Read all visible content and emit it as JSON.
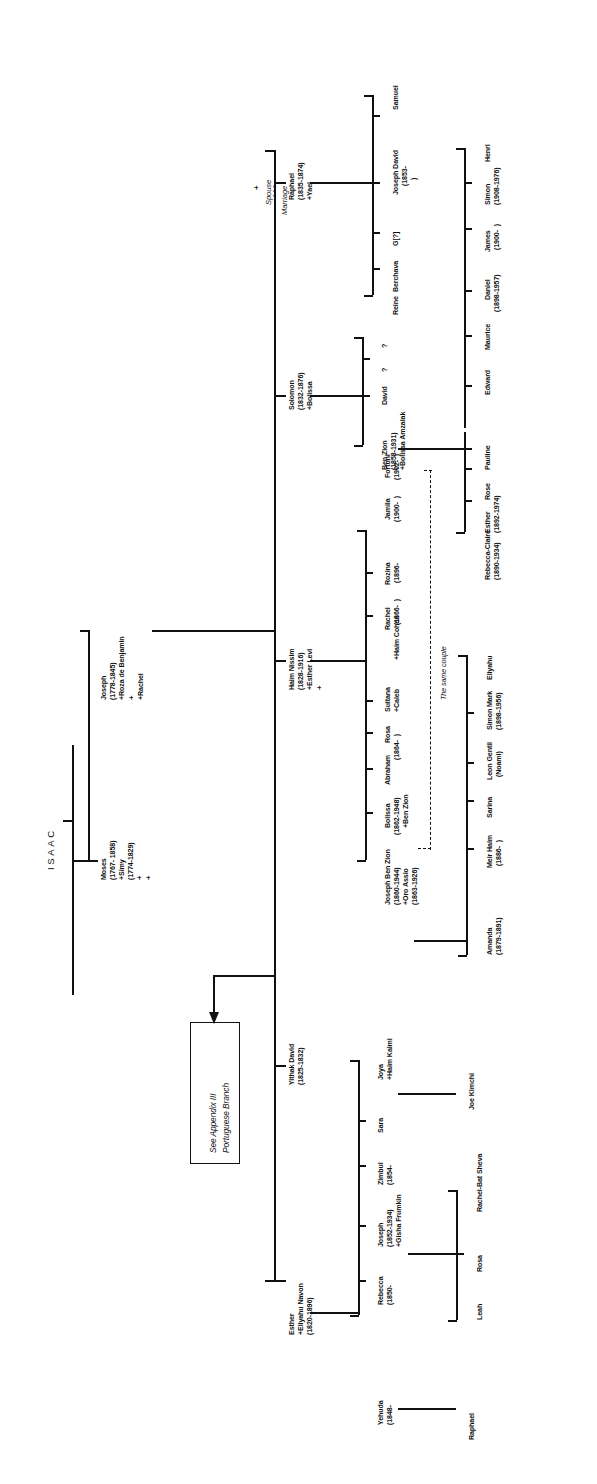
{
  "document": {
    "title": "ISAAC family genealogical chart",
    "root_label": "ISAAC",
    "orientation": "rotated-90",
    "legend": {
      "spouse_symbol": "+",
      "spouse_label": "Spouse",
      "marriage_symbol": "- - -",
      "marriage_label": "Marriage"
    },
    "callout_box": {
      "line1": "See Appendix III",
      "line2": "Portuguese Branch"
    },
    "annotations": {
      "same_couple": "The same couple"
    }
  },
  "generations": {
    "g1": [
      {
        "name": "Moses",
        "dates": "(1767- 1858)",
        "spouse1": "+Simy",
        "spouse1_dates": "(1774-1829)",
        "extra1": "+",
        "extra2": "+"
      },
      {
        "name": "Joseph",
        "dates": "(1778-1845)",
        "spouse1": "+Roza de Benjamin",
        "extra1": "+",
        "spouse2": "+Rachel"
      }
    ],
    "g2": [
      {
        "name": "Esther",
        "spouse": "+Eliyahu Navon",
        "dates": "(1820-1896)"
      },
      {
        "name": "Yithak David",
        "dates": "(1825-1832)"
      },
      {
        "name": "Haim Nissim",
        "dates": "(1828-1916)",
        "spouse": "+Esther Levi",
        "extra": "+"
      },
      {
        "name": "Solomon",
        "dates": "(1832-1876)",
        "spouse": "+Bolissa"
      },
      {
        "name": "Raphael",
        "dates": "(1835-1874)",
        "spouse": "+Yael"
      }
    ],
    "esther_children": [
      {
        "name": "Rebecca",
        "dates": "(1850-"
      },
      {
        "name": "Joseph",
        "dates": "(1852-1934)",
        "spouse": "+Gisha Frumkin"
      },
      {
        "name": "Zimbul",
        "dates": "(1854-"
      },
      {
        "name": "Sara"
      },
      {
        "name": "Joya",
        "spouse": "+Haim Kalmi"
      }
    ],
    "esther_grandchildren": [
      {
        "name": "Yehuda",
        "dates": "(1848-"
      },
      {
        "name": "Leah"
      },
      {
        "name": "Rosa"
      },
      {
        "name": "Rachel-Bat Sheva"
      },
      {
        "name": "Joe Kimchi"
      }
    ],
    "esther_great_grandchildren": [
      {
        "name": "Raphael"
      }
    ],
    "haim_nissim_children": [
      {
        "name": "Joseph Ben Zion",
        "dates": "(1860-1944)",
        "spouse": "+Oro Assio",
        "spouse_dates": "(1863-1926)"
      },
      {
        "name": "Bolissa",
        "dates": "(1862-1948)",
        "spouse": "+Ben Zion"
      },
      {
        "name": "Abraham",
        "dates": "(1864-  )"
      },
      {
        "name": "Rosa"
      },
      {
        "name": "Sultana",
        "spouse": "+Caleb"
      },
      {
        "name": "Rachel",
        "spouse": "+Haim Cohen",
        "spouse_dates": "(1866-  )"
      },
      {
        "name": "Rozina",
        "dates": "(1896-"
      },
      {
        "name": "Jamila",
        "dates": "(1900-  )"
      },
      {
        "name": "Fortuni",
        "dates": "(1902-  )"
      },
      {
        "name": "Ben Zion",
        "dates": "(1858-1931)",
        "spouse": "+Bolissa Amzalak"
      }
    ],
    "joseph_ben_zion_children": [
      {
        "name": "Amanda",
        "dates": "(1879-1891)"
      },
      {
        "name": "Meir Haim",
        "dates": "(1886-  )"
      },
      {
        "name": "Sarina"
      },
      {
        "name": "Leon Gentil",
        "alt": "(Noami)"
      },
      {
        "name": "Simon Mark",
        "dates": "(1898-1956)"
      },
      {
        "name": "Eliyahu"
      }
    ],
    "ben_zion_children": [
      {
        "name": "Rebecca-Claire",
        "dates": "(1890-1934)"
      },
      {
        "name": "Esther",
        "dates": "(1892-1974)"
      },
      {
        "name": "Rose"
      },
      {
        "name": "Pauline"
      },
      {
        "name": "Edward"
      },
      {
        "name": "Maurice"
      },
      {
        "name": "Daniel",
        "dates": "(1898-1957)"
      },
      {
        "name": "James",
        "dates": "(1900-  )"
      },
      {
        "name": "Simon",
        "dates": "(1908-1976)"
      },
      {
        "name": "Henri"
      }
    ],
    "solomon_children": [
      {
        "name": "David"
      },
      {
        "name": "?"
      },
      {
        "name": "?"
      }
    ],
    "raphael_children": [
      {
        "name": "Reine"
      },
      {
        "name": "Berchava"
      },
      {
        "name": "G[?]"
      },
      {
        "name": "Joseph David",
        "dates": "(1853-"
      },
      {
        "name": "Samuel"
      }
    ]
  }
}
